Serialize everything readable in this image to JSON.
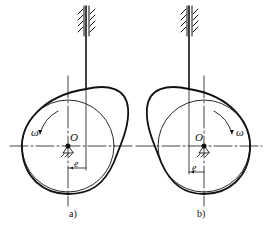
{
  "figure": {
    "type": "offset translating follower disc cam mechanisms",
    "panels": [
      {
        "id": "a",
        "caption": "a)",
        "center_label": "O",
        "omega_label": "ω",
        "offset_label": "e",
        "rotation": "counterclockwise",
        "offset_side": "right"
      },
      {
        "id": "b",
        "caption": "b)",
        "center_label": "O",
        "omega_label": "ω",
        "offset_label": "e",
        "rotation": "clockwise",
        "offset_side": "left"
      }
    ]
  },
  "colors": {
    "stroke": "#111111",
    "background": "#ffffff"
  }
}
